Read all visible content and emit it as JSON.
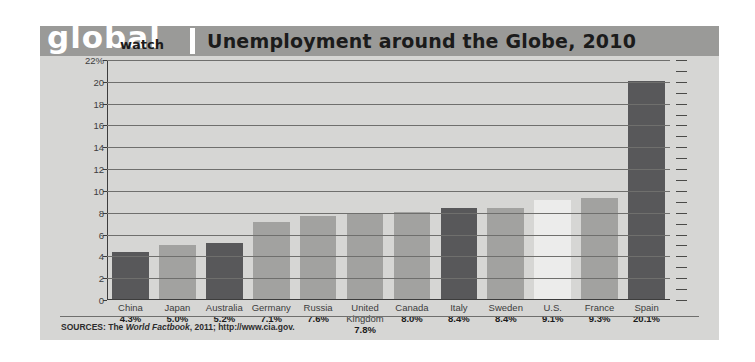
{
  "header": {
    "logo_main": "global",
    "logo_sub": "watch",
    "title": "Unemployment around the Globe, 2010"
  },
  "footer": {
    "sources_prefix": "SOURCES: The ",
    "sources_italic": "World Factbook",
    "sources_suffix": ", 2011; http://www.cia.gov."
  },
  "colors": {
    "card_background": "#d6d6d4",
    "header_band": "#9a9a98",
    "bar_dark": "#58585a",
    "bar_mid": "#a2a2a0",
    "bar_light": "#ececeb",
    "gridline": "#6f6f6d",
    "axis": "#3d3d3d"
  },
  "chart_data": {
    "type": "bar",
    "title": "Unemployment around the Globe, 2010",
    "xlabel": "",
    "ylabel": "",
    "ylim": [
      0,
      22
    ],
    "grid": true,
    "legend": "none",
    "ytick_labels": [
      "22%",
      "20",
      "18",
      "16",
      "14",
      "12",
      "10",
      "8",
      "6",
      "4",
      "2",
      "0"
    ],
    "ytick_values": [
      22,
      20,
      18,
      16,
      14,
      12,
      10,
      8,
      6,
      4,
      2,
      0
    ],
    "categories": [
      "China",
      "Japan",
      "Australia",
      "Germany",
      "Russia",
      "United Kingdom",
      "Canada",
      "Italy",
      "Sweden",
      "U.S.",
      "France",
      "Spain"
    ],
    "values": [
      4.3,
      5.0,
      5.2,
      7.1,
      7.6,
      7.8,
      8.0,
      8.4,
      8.4,
      9.1,
      9.3,
      20.1
    ],
    "value_labels": [
      "4.3%",
      "5.0%",
      "5.2%",
      "7.1%",
      "7.6%",
      "7.8%",
      "8.0%",
      "8.4%",
      "8.4%",
      "9.1%",
      "9.3%",
      "20.1%"
    ],
    "bar_shades": [
      "dark",
      "mid",
      "dark",
      "mid",
      "mid",
      "mid",
      "mid",
      "dark",
      "mid",
      "light",
      "mid",
      "dark"
    ]
  }
}
